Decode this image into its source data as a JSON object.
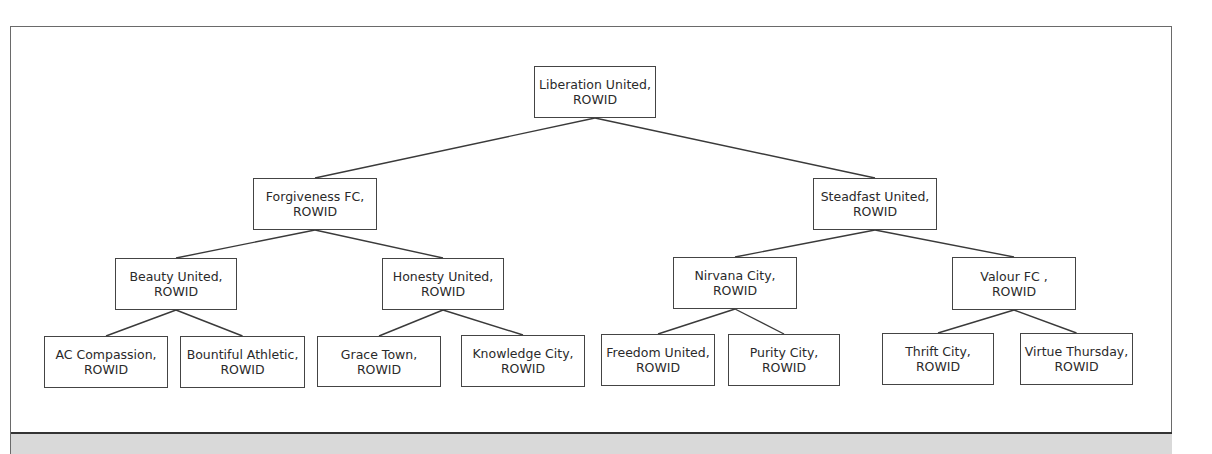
{
  "diagram": {
    "type": "binary-tree",
    "nodes": [
      {
        "id": "root",
        "name": "Liberation United,",
        "sub": "ROWID",
        "level": 0,
        "x": 534,
        "y": 66,
        "w": 122,
        "h": 52
      },
      {
        "id": "n1",
        "name": "Forgiveness FC,",
        "sub": "ROWID",
        "level": 1,
        "parent": "root",
        "x": 253,
        "y": 178,
        "w": 124,
        "h": 52
      },
      {
        "id": "n2",
        "name": "Steadfast United,",
        "sub": "ROWID",
        "level": 1,
        "parent": "root",
        "x": 813,
        "y": 178,
        "w": 124,
        "h": 52
      },
      {
        "id": "n3",
        "name": "Beauty United,",
        "sub": "ROWID",
        "level": 2,
        "parent": "n1",
        "x": 115,
        "y": 258,
        "w": 122,
        "h": 52
      },
      {
        "id": "n4",
        "name": "Honesty United,",
        "sub": "ROWID",
        "level": 2,
        "parent": "n1",
        "x": 382,
        "y": 258,
        "w": 122,
        "h": 52
      },
      {
        "id": "n5",
        "name": "Nirvana City,",
        "sub": "ROWID",
        "level": 2,
        "parent": "n2",
        "x": 673,
        "y": 257,
        "w": 124,
        "h": 52
      },
      {
        "id": "n6",
        "name": "Valour FC ,",
        "sub": "ROWID",
        "level": 2,
        "parent": "n2",
        "x": 952,
        "y": 257,
        "w": 124,
        "h": 53
      },
      {
        "id": "n7",
        "name": "AC Compassion,",
        "sub": "ROWID",
        "level": 3,
        "parent": "n3",
        "x": 44,
        "y": 336,
        "w": 124,
        "h": 52
      },
      {
        "id": "n8",
        "name": "Bountiful Athletic,",
        "sub": "ROWID",
        "level": 3,
        "parent": "n3",
        "x": 180,
        "y": 336,
        "w": 125,
        "h": 52
      },
      {
        "id": "n9",
        "name": "Grace Town,",
        "sub": "ROWID",
        "level": 3,
        "parent": "n4",
        "x": 317,
        "y": 336,
        "w": 124,
        "h": 51
      },
      {
        "id": "n10",
        "name": "Knowledge City,",
        "sub": "ROWID",
        "level": 3,
        "parent": "n4",
        "x": 461,
        "y": 335,
        "w": 124,
        "h": 52
      },
      {
        "id": "n11",
        "name": "Freedom United,",
        "sub": "ROWID",
        "level": 3,
        "parent": "n5",
        "x": 601,
        "y": 334,
        "w": 114,
        "h": 52
      },
      {
        "id": "n12",
        "name": "Purity City,",
        "sub": "ROWID",
        "level": 3,
        "parent": "n5",
        "x": 728,
        "y": 334,
        "w": 112,
        "h": 52
      },
      {
        "id": "n13",
        "name": "Thrift City,",
        "sub": "ROWID",
        "level": 3,
        "parent": "n6",
        "x": 882,
        "y": 333,
        "w": 112,
        "h": 52
      },
      {
        "id": "n14",
        "name": "Virtue Thursday,",
        "sub": "ROWID",
        "level": 3,
        "parent": "n6",
        "x": 1020,
        "y": 333,
        "w": 113,
        "h": 52
      }
    ],
    "colors": {
      "node_border": "#444444",
      "edge": "#3a3a3a",
      "text": "#2a2a2a",
      "frame": "#6a6a6a",
      "band": "#d9d9d9"
    }
  }
}
